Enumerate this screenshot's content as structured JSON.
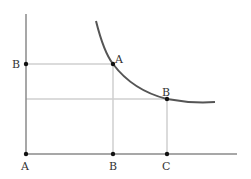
{
  "diagram": {
    "type": "indifference-curve-graph",
    "colors": {
      "axis": "#8a8a8a",
      "guide": "#cfcfcf",
      "curve": "#555555",
      "point": "#111111",
      "label": "#333333"
    },
    "labels": {
      "y_axis_point": "B",
      "curve_point_upper": "A",
      "curve_point_lower": "B",
      "x_origin": "A",
      "x_mid": "B",
      "x_right": "C"
    }
  }
}
